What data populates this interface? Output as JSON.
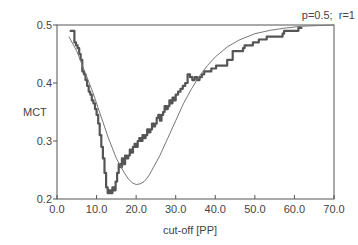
{
  "chart_data": {
    "type": "line",
    "title": "",
    "annotation": "p=0.5;  r=1",
    "xlabel": "cut-off [PP]",
    "ylabel": "MCT",
    "xlim": [
      0,
      70
    ],
    "ylim": [
      0.2,
      0.5
    ],
    "xticks": [
      0,
      10,
      20,
      30,
      40,
      50,
      60,
      70
    ],
    "xtick_labels": [
      "0.0",
      "10.0",
      "20.0",
      "30.0",
      "40.0",
      "50.0",
      "60.0",
      "70.0"
    ],
    "yticks": [
      0.2,
      0.3,
      0.4,
      0.5
    ],
    "ytick_labels": [
      "0.2",
      "0.3",
      "0.4",
      "0.5"
    ],
    "grid": false,
    "legend": null,
    "series": [
      {
        "name": "empirical (noisy step curve)",
        "style": "thick",
        "color": "#555555",
        "x": [
          3.2,
          4.0,
          4.4,
          4.8,
          5.2,
          5.6,
          6.0,
          6.4,
          6.8,
          7.2,
          7.6,
          8.0,
          8.4,
          8.8,
          9.2,
          9.6,
          10.0,
          10.4,
          10.8,
          11.2,
          11.6,
          12.0,
          12.4,
          12.8,
          13.2,
          13.6,
          14.0,
          14.4,
          14.8,
          15.2,
          15.6,
          16.0,
          16.4,
          16.8,
          17.2,
          17.6,
          18.0,
          18.4,
          18.8,
          19.2,
          19.6,
          20.0,
          20.4,
          20.8,
          21.2,
          21.6,
          22.0,
          22.4,
          22.8,
          23.2,
          23.6,
          24.0,
          24.4,
          24.8,
          25.2,
          25.6,
          26.0,
          26.4,
          26.8,
          27.2,
          27.6,
          28.0,
          28.4,
          28.8,
          29.2,
          29.6,
          30.0,
          30.6,
          31.2,
          31.8,
          32.4,
          33.0,
          33.6,
          34.2,
          34.8,
          35.4,
          36.0,
          36.6,
          37.2,
          37.8,
          38.4,
          39.0,
          39.6,
          40.2,
          41.0,
          42.0,
          43.0,
          44.0,
          44.4,
          45.0,
          46.0,
          47.0,
          47.4,
          48.5,
          49.5,
          50.0,
          51.0,
          52.0,
          53.0,
          54.0,
          55.0,
          56.0,
          57.0,
          57.4,
          58.5,
          59.5,
          60.0,
          61.0,
          62.0
        ],
        "y": [
          0.49,
          0.49,
          0.47,
          0.465,
          0.46,
          0.45,
          0.44,
          0.42,
          0.415,
          0.405,
          0.395,
          0.385,
          0.38,
          0.37,
          0.365,
          0.355,
          0.345,
          0.33,
          0.31,
          0.29,
          0.27,
          0.245,
          0.22,
          0.21,
          0.215,
          0.21,
          0.22,
          0.215,
          0.23,
          0.245,
          0.26,
          0.255,
          0.27,
          0.26,
          0.275,
          0.27,
          0.275,
          0.285,
          0.28,
          0.29,
          0.295,
          0.29,
          0.3,
          0.305,
          0.3,
          0.31,
          0.305,
          0.31,
          0.32,
          0.315,
          0.32,
          0.33,
          0.325,
          0.33,
          0.34,
          0.345,
          0.335,
          0.345,
          0.35,
          0.36,
          0.355,
          0.36,
          0.37,
          0.365,
          0.375,
          0.37,
          0.38,
          0.385,
          0.39,
          0.395,
          0.4,
          0.415,
          0.41,
          0.405,
          0.41,
          0.405,
          0.41,
          0.415,
          0.42,
          0.42,
          0.42,
          0.425,
          0.425,
          0.43,
          0.43,
          0.43,
          0.44,
          0.44,
          0.455,
          0.455,
          0.455,
          0.46,
          0.465,
          0.465,
          0.47,
          0.47,
          0.475,
          0.475,
          0.48,
          0.48,
          0.48,
          0.48,
          0.485,
          0.49,
          0.49,
          0.49,
          0.49,
          0.495,
          0.495
        ]
      },
      {
        "name": "theoretical (smooth curve)",
        "style": "thin",
        "color": "#777777",
        "x": [
          3.0,
          5.0,
          7.0,
          9.0,
          11.0,
          13.0,
          15.0,
          17.0,
          18.0,
          19.0,
          20.0,
          21.0,
          22.0,
          23.0,
          24.0,
          26.0,
          28.0,
          30.0,
          32.0,
          34.0,
          36.0,
          38.0,
          40.0,
          43.0,
          46.0,
          50.0,
          54.0,
          58.0,
          62.0,
          66.0,
          70.0
        ],
        "y": [
          0.48,
          0.455,
          0.42,
          0.385,
          0.345,
          0.305,
          0.27,
          0.245,
          0.235,
          0.228,
          0.225,
          0.226,
          0.23,
          0.238,
          0.25,
          0.275,
          0.305,
          0.335,
          0.365,
          0.39,
          0.412,
          0.43,
          0.445,
          0.462,
          0.474,
          0.485,
          0.491,
          0.495,
          0.498,
          0.499,
          0.5
        ]
      }
    ]
  }
}
